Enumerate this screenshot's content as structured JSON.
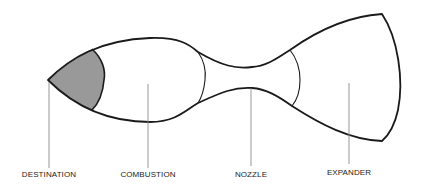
{
  "diagram": {
    "title": "",
    "colors": {
      "outline": "#1a1a1a",
      "leader": "#8a8a8a",
      "shaded_region": "#999999",
      "background": "#ffffff"
    },
    "sections": [
      {
        "id": "destination",
        "label": "DESTINATION",
        "shaded": true,
        "label_x": 49
      },
      {
        "id": "combustion",
        "label": "COMBUSTION",
        "shaded": false,
        "label_x": 148
      },
      {
        "id": "nozzle",
        "label": "NOZZLE",
        "shaded": false,
        "label_x": 251
      },
      {
        "id": "expander",
        "label": "EXPANDER",
        "shaded": false,
        "label_x": 349
      }
    ]
  }
}
